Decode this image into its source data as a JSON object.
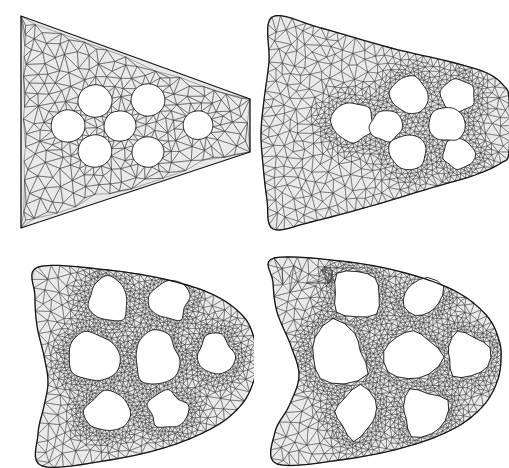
{
  "figure": {
    "background_color": "#ffffff",
    "mesh_fill_color": "#e9e9e9",
    "mesh_line_color": "#3a3a3a",
    "outline_color": "#161616",
    "hole_color": "#ffffff",
    "layout": {
      "rows": 2,
      "cols": 2,
      "panel_width": 254,
      "panel_height": 234
    }
  },
  "panels": [
    {
      "id": "panel-1",
      "name": "mesh-panel-initial",
      "label": "",
      "stage": 1,
      "position": {
        "row": 0,
        "col": 0
      },
      "description": "Trapezoidal cantilever domain, straight edges, coarse-to-medium triangular mesh, seven circular holes",
      "mesh": {
        "density": "medium",
        "refined_bands": "around holes and left edge",
        "triangle_count_approx": 900
      },
      "outline": [
        [
          21,
          16
        ],
        [
          250,
          99
        ],
        [
          250,
          152
        ],
        [
          21,
          228
        ]
      ],
      "outline_curved": false,
      "holes": [
        {
          "cx": 95,
          "cy": 101,
          "r": 17,
          "shape": "circle"
        },
        {
          "cx": 148,
          "cy": 100,
          "r": 17,
          "shape": "circle"
        },
        {
          "cx": 68,
          "cy": 126,
          "r": 17,
          "shape": "circle"
        },
        {
          "cx": 120,
          "cy": 126,
          "r": 16,
          "shape": "circle"
        },
        {
          "cx": 198,
          "cy": 125,
          "r": 15,
          "shape": "circle"
        },
        {
          "cx": 95,
          "cy": 151,
          "r": 17,
          "shape": "circle"
        },
        {
          "cx": 148,
          "cy": 152,
          "r": 16,
          "shape": "circle"
        }
      ]
    },
    {
      "id": "panel-2",
      "name": "mesh-panel-early-shape-change",
      "label": "",
      "stage": 2,
      "position": {
        "row": 0,
        "col": 1
      },
      "description": "Domain with concave left edge and wavy upper/lower boundaries, strongly refined mesh around seven rounded polygonal holes",
      "mesh": {
        "density": "medium-fine",
        "refined_bands": "dense ring around hole cluster",
        "triangle_count_approx": 1800
      },
      "outline": [
        [
          11,
          17
        ],
        [
          60,
          28
        ],
        [
          130,
          48
        ],
        [
          190,
          62
        ],
        [
          226,
          73
        ],
        [
          243,
          86
        ],
        [
          248,
          99
        ],
        [
          248,
          152
        ],
        [
          240,
          163
        ],
        [
          214,
          175
        ],
        [
          170,
          188
        ],
        [
          110,
          206
        ],
        [
          50,
          222
        ],
        [
          12,
          229
        ],
        [
          6,
          200
        ],
        [
          2,
          165
        ],
        [
          0,
          133
        ],
        [
          3,
          100
        ],
        [
          8,
          62
        ]
      ],
      "outline_curved": true,
      "holes": [
        {
          "cx": 92,
          "cy": 122,
          "r": 21,
          "shape": "rounded-polygon"
        },
        {
          "cx": 148,
          "cy": 95,
          "r": 19,
          "shape": "rounded-polygon"
        },
        {
          "cx": 147,
          "cy": 152,
          "r": 19,
          "shape": "rounded-polygon"
        },
        {
          "cx": 125,
          "cy": 126,
          "r": 16,
          "shape": "rounded-polygon"
        },
        {
          "cx": 197,
          "cy": 96,
          "r": 17,
          "shape": "rounded-polygon"
        },
        {
          "cx": 198,
          "cy": 154,
          "r": 16,
          "shape": "rounded-polygon"
        },
        {
          "cx": 187,
          "cy": 124,
          "r": 18,
          "shape": "rounded-polygon"
        }
      ]
    },
    {
      "id": "panel-3",
      "name": "mesh-panel-intermediate",
      "label": "",
      "stage": 3,
      "position": {
        "row": 1,
        "col": 0
      },
      "description": "Domain with deep concave waist on left edge, rounded right nose, merged organic voids forming a lattice",
      "mesh": {
        "density": "fine near void boundaries",
        "refined_bands": "very dense along thin ligaments",
        "triangle_count_approx": 3000
      },
      "outline": [
        [
          20,
          11
        ],
        [
          90,
          14
        ],
        [
          150,
          24
        ],
        [
          196,
          39
        ],
        [
          225,
          60
        ],
        [
          236,
          82
        ],
        [
          238,
          103
        ],
        [
          236,
          124
        ],
        [
          224,
          148
        ],
        [
          198,
          170
        ],
        [
          152,
          190
        ],
        [
          92,
          204
        ],
        [
          24,
          210
        ],
        [
          20,
          178
        ],
        [
          26,
          150
        ],
        [
          30,
          126
        ],
        [
          26,
          100
        ],
        [
          19,
          70
        ],
        [
          17,
          40
        ]
      ],
      "outline_curved": true,
      "holes": [
        {
          "cx": 76,
          "cy": 101,
          "r": 26,
          "shape": "organic"
        },
        {
          "cx": 90,
          "cy": 44,
          "r": 22,
          "shape": "organic"
        },
        {
          "cx": 92,
          "cy": 157,
          "r": 22,
          "shape": "organic"
        },
        {
          "cx": 138,
          "cy": 100,
          "r": 25,
          "shape": "organic"
        },
        {
          "cx": 150,
          "cy": 46,
          "r": 20,
          "shape": "organic"
        },
        {
          "cx": 150,
          "cy": 155,
          "r": 20,
          "shape": "organic"
        },
        {
          "cx": 196,
          "cy": 100,
          "r": 20,
          "shape": "organic"
        }
      ]
    },
    {
      "id": "panel-4",
      "name": "mesh-panel-converged-truss",
      "label": "",
      "stage": 4,
      "position": {
        "row": 1,
        "col": 1
      },
      "description": "Converged truss-like topology, extreme concave pinch on left edge, large angular voids separated by thin dense members",
      "mesh": {
        "density": "very fine along members",
        "refined_bands": "thin load-carrying struts",
        "triangle_count_approx": 3400
      },
      "outline": [
        [
          5,
          4
        ],
        [
          80,
          8
        ],
        [
          140,
          20
        ],
        [
          188,
          38
        ],
        [
          218,
          62
        ],
        [
          230,
          86
        ],
        [
          232,
          106
        ],
        [
          228,
          128
        ],
        [
          214,
          152
        ],
        [
          186,
          174
        ],
        [
          140,
          192
        ],
        [
          78,
          205
        ],
        [
          8,
          210
        ],
        [
          6,
          178
        ],
        [
          20,
          152
        ],
        [
          30,
          122
        ],
        [
          22,
          92
        ],
        [
          8,
          58
        ],
        [
          4,
          28
        ]
      ],
      "outline_curved": true,
      "holes": [
        {
          "cx": 70,
          "cy": 100,
          "r": 30,
          "shape": "angular"
        },
        {
          "cx": 88,
          "cy": 40,
          "r": 25,
          "shape": "angular"
        },
        {
          "cx": 88,
          "cy": 160,
          "r": 25,
          "shape": "angular"
        },
        {
          "cx": 142,
          "cy": 100,
          "r": 26,
          "shape": "angular"
        },
        {
          "cx": 152,
          "cy": 44,
          "r": 23,
          "shape": "angular"
        },
        {
          "cx": 152,
          "cy": 158,
          "r": 23,
          "shape": "angular"
        },
        {
          "cx": 196,
          "cy": 101,
          "r": 21,
          "shape": "angular"
        }
      ]
    }
  ]
}
